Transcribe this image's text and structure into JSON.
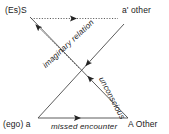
{
  "diagram": {
    "background_color": "#ffffff",
    "line_color": "#3a3a3a",
    "text_color": "#1a1a1a",
    "corners": {
      "top_left": "(Es)S",
      "top_right": "aʹ other",
      "bottom_left": "(ego) a",
      "bottom_right": "A Other"
    },
    "edges": {
      "bottom": "missed encounter",
      "diagonal_imaginary": "imaginary relation",
      "diagonal_unconscious": "unconscious"
    },
    "arrows": [
      {
        "name": "symbolic-chain-arrow",
        "from": "(Es)S",
        "to": "aʹ other",
        "style": "dotted",
        "label": ""
      },
      {
        "name": "unconscious-return-arrow",
        "from": "A Other",
        "to": "(Es)S",
        "style": "dotted",
        "label": ""
      },
      {
        "name": "imaginary-relation-arrow",
        "from": "aʹ other",
        "to": "(ego) a",
        "style": "solid",
        "label": "imaginary relation"
      },
      {
        "name": "unconscious-arrow",
        "from": "A Other",
        "to": "(Es)S",
        "style": "solid",
        "label": "unconscious"
      },
      {
        "name": "missed-encounter-arrow",
        "from": "(ego) a",
        "to": "A Other",
        "style": "solid",
        "label": "missed encounter"
      }
    ]
  }
}
